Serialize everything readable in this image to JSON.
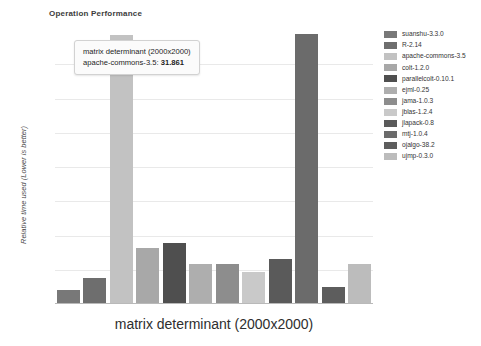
{
  "chart_data": {
    "type": "bar",
    "title": "Operation Performance",
    "xlabel": "matrix determinant (2000x2000)",
    "ylabel": "Relative time used (Lower is better)",
    "grid": true,
    "legend_position": "right",
    "ylim": [
      0,
      32.5
    ],
    "gridlines": 7,
    "categories": [
      "suanshu-3.3.0",
      "R-2.14",
      "apache-commons-3.5",
      "colt-1.2.0",
      "parallelcolt-0.10.1",
      "ejml-0.25",
      "jama-1.0.3",
      "jblas-1.2.4",
      "jlapack-0.8",
      "mtj-1.0.4",
      "ojalgo-38.2",
      "ujmp-0.3.0"
    ],
    "values": [
      1.55,
      2.95,
      31.861,
      6.55,
      7.05,
      4.55,
      4.55,
      3.65,
      5.15,
      32.0,
      1.85,
      4.55
    ],
    "colors": [
      "#787878",
      "#6e6e6e",
      "#c2c2c2",
      "#a8a8a8",
      "#4f4f4f",
      "#aeaeae",
      "#8d8d8d",
      "#c9c9c9",
      "#5a5a5a",
      "#6b6b6b",
      "#5d5d5d",
      "#bcbcbc"
    ]
  },
  "tooltip": {
    "series_label": "matrix determinant (2000x2000)",
    "item_label": "apache-commons-3.5:",
    "value": "31.861"
  }
}
